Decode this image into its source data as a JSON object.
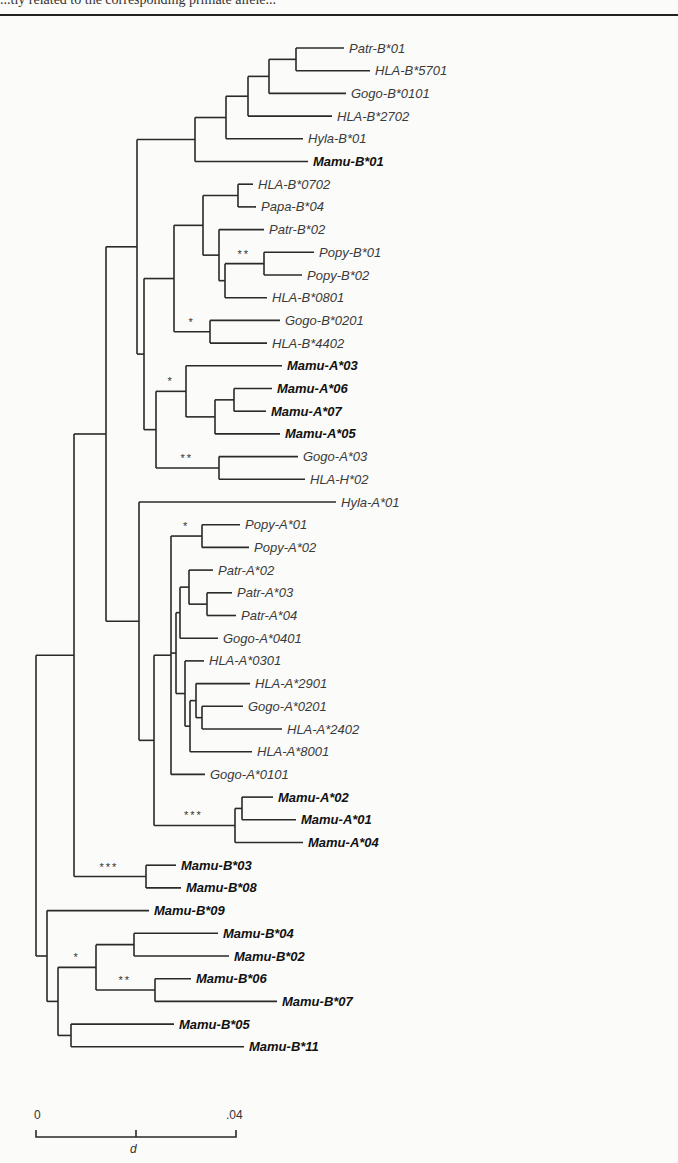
{
  "figure": {
    "header_fragment": "...tly related to the corresponding primate allele...",
    "scale_bar": {
      "start_label": "0",
      "end_label": ".04",
      "axis_label": "d",
      "max_distance": 0.04,
      "mid_tick": 0.02
    }
  },
  "tree": {
    "bl": 0,
    "children": [
      {
        "bl": 0.0076,
        "children": [
          {
            "bl": 0.0064,
            "children": [
              {
                "bl": 0.0062,
                "children": [
                  {
                    "bl": 0.0116,
                    "children": [
                      {
                        "bl": 0.0062,
                        "children": [
                          {
                            "bl": 0.0044,
                            "children": [
                              {
                                "bl": 0.0042,
                                "children": [
                                  {
                                    "bl": 0.0054,
                                    "support": "",
                                    "children": [
                                      {
                                        "bl": 0.0096,
                                        "name": "Patr-B*01",
                                        "bold": false
                                      },
                                      {
                                        "bl": 0.0148,
                                        "name": "HLA-B*5701",
                                        "bold": false
                                      }
                                    ]
                                  },
                                  {
                                    "bl": 0.0154,
                                    "name": "Gogo-B*0101",
                                    "bold": false
                                  }
                                ]
                              },
                              {
                                "bl": 0.0168,
                                "name": "HLA-B*2702",
                                "bold": false
                              }
                            ]
                          },
                          {
                            "bl": 0.0154,
                            "name": "Hyla-B*01",
                            "bold": false
                          }
                        ]
                      },
                      {
                        "bl": 0.0226,
                        "name": "Mamu-B*01",
                        "bold": true
                      }
                    ]
                  },
                  {
                    "bl": 0.0014,
                    "children": [
                      {
                        "bl": 0.006,
                        "children": [
                          {
                            "bl": 0.0058,
                            "children": [
                              {
                                "bl": 0.007,
                                "children": [
                                  {
                                    "bl": 0.003,
                                    "name": "HLA-B*0702",
                                    "bold": false
                                  },
                                  {
                                    "bl": 0.0036,
                                    "name": "Papa-B*04",
                                    "bold": false
                                  }
                                ]
                              },
                              {
                                "bl": 0.0032,
                                "children": [
                                  {
                                    "bl": 0.009,
                                    "name": "Patr-B*02",
                                    "bold": false
                                  },
                                  {
                                    "bl": 0.0012,
                                    "children": [
                                      {
                                        "bl": 0.0078,
                                        "support": "**",
                                        "children": [
                                          {
                                            "bl": 0.01,
                                            "name": "Popy-B*01",
                                            "bold": false
                                          },
                                          {
                                            "bl": 0.0076,
                                            "name": "Popy-B*02",
                                            "bold": false
                                          }
                                        ]
                                      },
                                      {
                                        "bl": 0.0084,
                                        "name": "HLA-B*0801",
                                        "bold": false
                                      }
                                    ]
                                  }
                                ]
                              }
                            ]
                          },
                          {
                            "bl": 0.0072,
                            "support": "*",
                            "children": [
                              {
                                "bl": 0.014,
                                "name": "Gogo-B*0201",
                                "bold": false
                              },
                              {
                                "bl": 0.0114,
                                "name": "HLA-B*4402",
                                "bold": false
                              }
                            ]
                          }
                        ]
                      },
                      {
                        "bl": 0.0024,
                        "children": [
                          {
                            "bl": 0.006,
                            "support": "*",
                            "children": [
                              {
                                "bl": 0.0192,
                                "name": "Mamu-A*03",
                                "bold": true
                              },
                              {
                                "bl": 0.0058,
                                "children": [
                                  {
                                    "bl": 0.0038,
                                    "children": [
                                      {
                                        "bl": 0.0076,
                                        "name": "Mamu-A*06",
                                        "bold": true
                                      },
                                      {
                                        "bl": 0.0064,
                                        "name": "Mamu-A*07",
                                        "bold": true
                                      }
                                    ]
                                  },
                                  {
                                    "bl": 0.013,
                                    "name": "Mamu-A*05",
                                    "bold": true
                                  }
                                ]
                              }
                            ]
                          },
                          {
                            "bl": 0.0126,
                            "support": "**",
                            "children": [
                              {
                                "bl": 0.0158,
                                "name": "Gogo-A*03",
                                "bold": false
                              },
                              {
                                "bl": 0.0172,
                                "name": "HLA-H*02",
                                "bold": false
                              }
                            ]
                          }
                        ]
                      }
                    ]
                  }
                ]
              },
              {
                "bl": 0.0066,
                "children": [
                  {
                    "bl": 0.0394,
                    "name": "Hyla-A*01",
                    "bold": false
                  },
                  {
                    "bl": 0.003,
                    "children": [
                      {
                        "bl": 0.0034,
                        "children": [
                          {
                            "bl": 0.0062,
                            "support": "*",
                            "children": [
                              {
                                "bl": 0.0076,
                                "name": "Popy-A*01",
                                "bold": false
                              },
                              {
                                "bl": 0.0094,
                                "name": "Popy-A*02",
                                "bold": false
                              }
                            ]
                          },
                          {
                            "bl": 0.001,
                            "children": [
                              {
                                "bl": 0.0008,
                                "children": [
                                  {
                                    "bl": 0.0018,
                                    "children": [
                                      {
                                        "bl": 0.0048,
                                        "name": "Patr-A*02",
                                        "bold": false
                                      },
                                      {
                                        "bl": 0.0036,
                                        "children": [
                                          {
                                            "bl": 0.005,
                                            "name": "Patr-A*03",
                                            "bold": false
                                          },
                                          {
                                            "bl": 0.0058,
                                            "name": "Patr-A*04",
                                            "bold": false
                                          }
                                        ]
                                      }
                                    ]
                                  },
                                  {
                                    "bl": 0.0076,
                                    "name": "Gogo-A*0401",
                                    "bold": false
                                  }
                                ]
                              },
                              {
                                "bl": 0.0018,
                                "children": [
                                  {
                                    "bl": 0.0038,
                                    "name": "HLA-A*0301",
                                    "bold": false
                                  },
                                  {
                                    "bl": 0.001,
                                    "children": [
                                      {
                                        "bl": 0.0012,
                                        "children": [
                                          {
                                            "bl": 0.0108,
                                            "name": "HLA-A*2901",
                                            "bold": false
                                          },
                                          {
                                            "bl": 0.0012,
                                            "children": [
                                              {
                                                "bl": 0.0082,
                                                "name": "Gogo-A*0201",
                                                "bold": false
                                              },
                                              {
                                                "bl": 0.016,
                                                "name": "HLA-A*2402",
                                                "bold": false
                                              }
                                            ]
                                          }
                                        ]
                                      },
                                      {
                                        "bl": 0.0124,
                                        "name": "HLA-A*8001",
                                        "bold": false
                                      }
                                    ]
                                  }
                                ]
                              }
                            ]
                          },
                          {
                            "bl": 0.0068,
                            "name": "Gogo-A*0101",
                            "bold": false
                          }
                        ]
                      },
                      {
                        "bl": 0.0162,
                        "support": "***",
                        "children": [
                          {
                            "bl": 0.0014,
                            "children": [
                              {
                                "bl": 0.0062,
                                "name": "Mamu-A*02",
                                "bold": true
                              },
                              {
                                "bl": 0.0108,
                                "name": "Mamu-A*01",
                                "bold": true
                              }
                            ]
                          },
                          {
                            "bl": 0.0136,
                            "name": "Mamu-A*04",
                            "bold": true
                          }
                        ]
                      }
                    ]
                  }
                ]
              }
            ]
          },
          {
            "bl": 0.0144,
            "support": "***",
            "children": [
              {
                "bl": 0.006,
                "name": "Mamu-B*03",
                "bold": true
              },
              {
                "bl": 0.007,
                "name": "Mamu-B*08",
                "bold": true
              }
            ]
          }
        ]
      },
      {
        "bl": 0.0022,
        "children": [
          {
            "bl": 0.0204,
            "name": "Mamu-B*09",
            "bold": true
          },
          {
            "bl": 0.0022,
            "children": [
              {
                "bl": 0.0076,
                "support": "*",
                "children": [
                  {
                    "bl": 0.0076,
                    "children": [
                      {
                        "bl": 0.0168,
                        "name": "Mamu-B*04",
                        "bold": true
                      },
                      {
                        "bl": 0.019,
                        "name": "Mamu-B*02",
                        "bold": true
                      }
                    ]
                  },
                  {
                    "bl": 0.0118,
                    "support": "**",
                    "children": [
                      {
                        "bl": 0.0072,
                        "name": "Mamu-B*06",
                        "bold": true
                      },
                      {
                        "bl": 0.0244,
                        "name": "Mamu-B*07",
                        "bold": true
                      }
                    ]
                  }
                ]
              },
              {
                "bl": 0.0026,
                "children": [
                  {
                    "bl": 0.0206,
                    "name": "Mamu-B*05",
                    "bold": true
                  },
                  {
                    "bl": 0.0346,
                    "name": "Mamu-B*11",
                    "bold": true
                  }
                ]
              }
            ]
          }
        ]
      }
    ]
  }
}
